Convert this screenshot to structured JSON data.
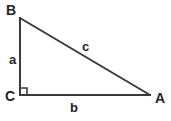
{
  "figure": {
    "type": "right-triangle-diagram",
    "background_color": "#ffffff",
    "stroke_color": "#3a3a3a",
    "text_color": "#232323",
    "stroke_width": 2,
    "vertices": [
      {
        "id": "B",
        "label": "B",
        "x": 20,
        "y": 18
      },
      {
        "id": "C",
        "label": "C",
        "x": 20,
        "y": 95
      },
      {
        "id": "A",
        "label": "A",
        "x": 150,
        "y": 95
      }
    ],
    "sides": [
      {
        "id": "a",
        "label": "a",
        "from": "B",
        "to": "C",
        "role": "vertical-leg"
      },
      {
        "id": "b",
        "label": "b",
        "from": "C",
        "to": "A",
        "role": "horizontal-leg"
      },
      {
        "id": "c",
        "label": "c",
        "from": "B",
        "to": "A",
        "role": "hypotenuse"
      }
    ],
    "right_angle": {
      "at": "C",
      "marker": "square",
      "size": 7,
      "label": ""
    }
  }
}
